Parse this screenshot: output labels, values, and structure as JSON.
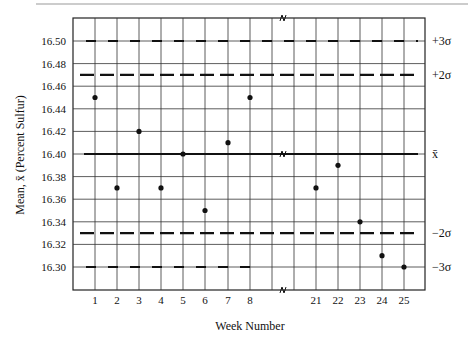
{
  "chart_data": {
    "type": "scatter",
    "title": "",
    "xlabel": "Week Number",
    "ylabel": "Mean, x̄ (Percent Sulfur)",
    "ylim": [
      16.28,
      16.52
    ],
    "yticks": [
      16.3,
      16.32,
      16.34,
      16.36,
      16.38,
      16.4,
      16.42,
      16.44,
      16.46,
      16.48,
      16.5
    ],
    "ytick_labels": [
      "16.30",
      "16.32",
      "16.34",
      "16.36",
      "16.38",
      "16.40",
      "16.42",
      "16.44",
      "16.46",
      "16.48",
      "16.50"
    ],
    "xtick_labels": [
      "1",
      "2",
      "3",
      "4",
      "5",
      "6",
      "7",
      "8",
      "21",
      "22",
      "23",
      "24",
      "25"
    ],
    "axis_break": "between week 8 and week 21",
    "grid": true,
    "series": [
      {
        "name": "Weekly mean",
        "x": [
          "1",
          "2",
          "3",
          "4",
          "5",
          "6",
          "7",
          "8",
          "21",
          "22",
          "23",
          "24",
          "25"
        ],
        "values": [
          16.45,
          16.37,
          16.42,
          16.37,
          16.4,
          16.35,
          16.41,
          16.45,
          16.37,
          16.39,
          16.34,
          16.31,
          16.3
        ]
      }
    ],
    "reference_lines": [
      {
        "label": "+3σ",
        "value": 16.5,
        "style": "dash-short"
      },
      {
        "label": "+2σ",
        "value": 16.47,
        "style": "dash-long"
      },
      {
        "label": "x̄",
        "value": 16.4,
        "style": "solid"
      },
      {
        "label": "−2σ",
        "value": 16.33,
        "style": "dash-long"
      },
      {
        "label": "−3σ",
        "value": 16.3,
        "style": "dash-short"
      }
    ]
  }
}
